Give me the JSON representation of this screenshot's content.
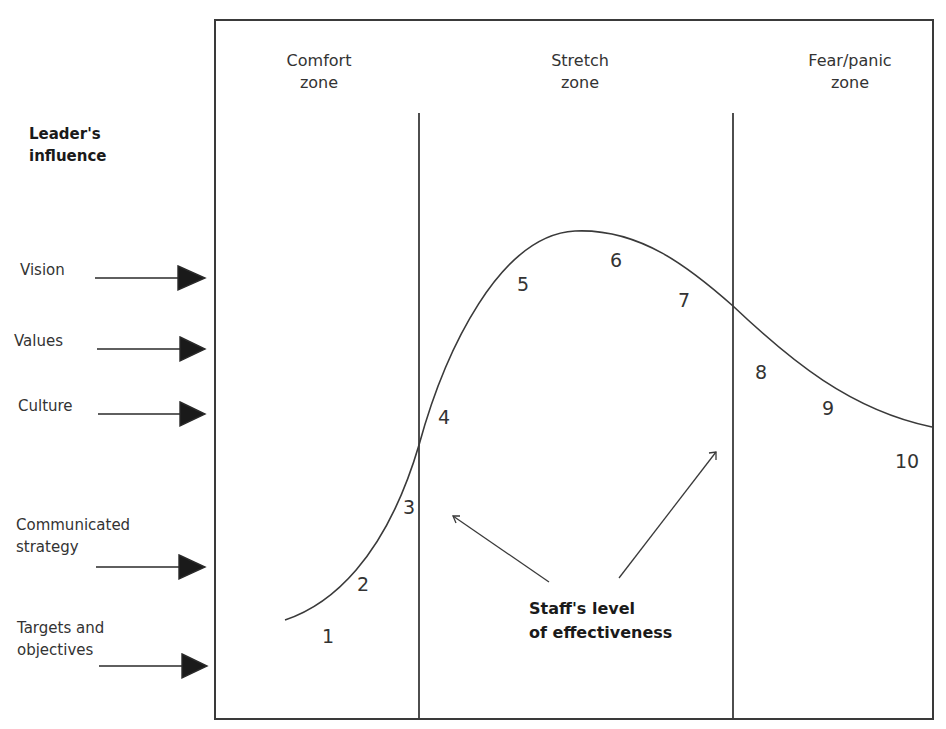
{
  "diagram": {
    "zones": [
      {
        "label": "Comfort\nzone"
      },
      {
        "label": "Stretch\nzone"
      },
      {
        "label": "Fear/panic\nzone"
      }
    ],
    "left_heading": "Leader's\ninfluence",
    "influences": [
      {
        "label": "Vision"
      },
      {
        "label": "Values"
      },
      {
        "label": "Culture"
      },
      {
        "label": "Communicated\nstrategy"
      },
      {
        "label": "Targets and\nobjectives"
      }
    ],
    "curve_points": [
      "1",
      "2",
      "3",
      "4",
      "5",
      "6",
      "7",
      "8",
      "9",
      "10"
    ],
    "center_label": "Staff's level\nof effectiveness",
    "colors": {
      "line": "#3a3a3a",
      "text": "#333333",
      "background": "#ffffff"
    }
  }
}
